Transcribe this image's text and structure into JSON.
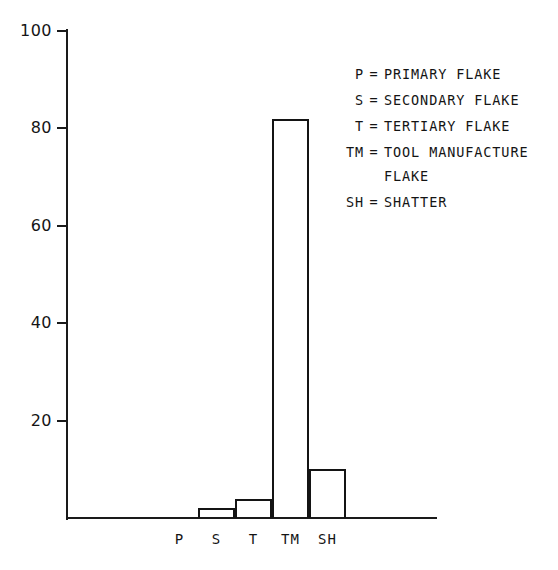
{
  "chart_data": {
    "type": "bar",
    "title": "",
    "subtitle": "",
    "xlabel": "",
    "ylabel": "",
    "categories": [
      "P",
      "S",
      "T",
      "TM",
      "SH"
    ],
    "values": [
      0,
      2,
      4,
      82,
      10
    ],
    "ylim": [
      0,
      100
    ],
    "yticks": [
      20,
      40,
      60,
      80,
      100
    ],
    "ytick_labels": [
      "20",
      "40",
      "60",
      "80",
      "100"
    ],
    "grid": false,
    "legend_position": "upper-right-inside",
    "bar_style": "outlined-unfilled",
    "legend": [
      {
        "key": "P",
        "separator": "=",
        "description": "PRIMARY FLAKE"
      },
      {
        "key": "S",
        "separator": "=",
        "description": "SECONDARY FLAKE"
      },
      {
        "key": "T",
        "separator": "=",
        "description": "TERTIARY FLAKE"
      },
      {
        "key": "TM",
        "separator": "=",
        "description": "TOOL MANUFACTURE\nFLAKE"
      },
      {
        "key": "SH",
        "separator": "=",
        "description": "SHATTER"
      }
    ],
    "colors": {
      "background": "#ffffff",
      "axis": "#1a1a1a",
      "bar_outline": "#141414",
      "bar_fill": "transparent",
      "text": "#141414"
    }
  }
}
